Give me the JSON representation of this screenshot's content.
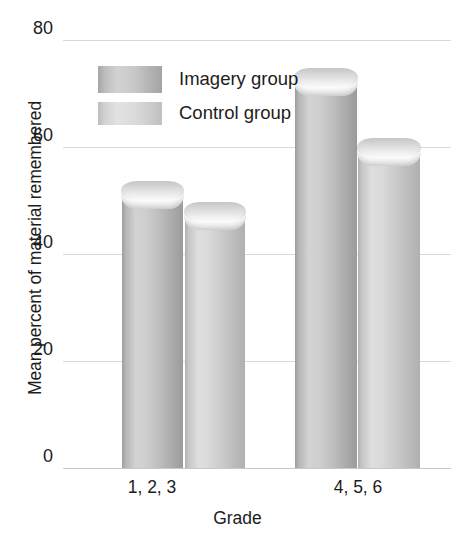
{
  "chart_data": {
    "type": "bar",
    "title": "",
    "xlabel": "Grade",
    "ylabel": "Mean percent of material remembered",
    "categories": [
      "1, 2, 3",
      "4, 5, 6"
    ],
    "series": [
      {
        "name": "Imagery group",
        "values": [
          52,
          73
        ],
        "color": "#bdbdbd"
      },
      {
        "name": "Control group",
        "values": [
          48,
          60
        ],
        "color": "#d4d4d4"
      }
    ],
    "ylim": [
      0,
      80
    ],
    "yticks": [
      0,
      20,
      40,
      60,
      80
    ],
    "ytick_labels": [
      "0",
      "20",
      "40",
      "60",
      "80"
    ],
    "grid": true,
    "legend_position": "upper-left-inside",
    "style": "3d-cylinder-bars",
    "background": "#ffffff",
    "text_color": "#1c1c1c",
    "gridline_color": "#d9d9d9"
  },
  "legend": {
    "items": [
      {
        "label": "Imagery group"
      },
      {
        "label": "Control group"
      }
    ]
  },
  "axes": {
    "y_title": "Mean percent of material remembered",
    "x_title": "Grade"
  }
}
